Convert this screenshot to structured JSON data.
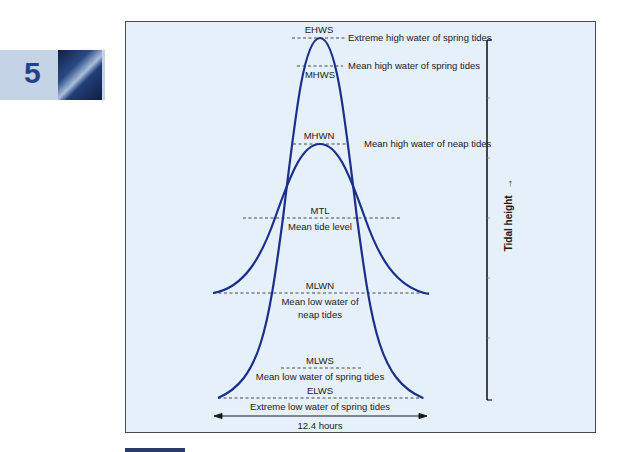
{
  "chapter": {
    "number": "5",
    "thumbnail": "chapter-photo-coastal-water"
  },
  "diagram": {
    "colors": {
      "panel_background": "#e6f0fa",
      "curve": "#1a2f8a",
      "dashed": "#333333",
      "chapter_tab": "#c4d3e6",
      "chapter_number": "#24418c"
    },
    "levels": [
      {
        "abbr": "EHWS",
        "name": "Extreme high water of spring tides"
      },
      {
        "abbr": "MHWS",
        "name": "Mean high water of spring tides"
      },
      {
        "abbr": "MHWN",
        "name": "Mean high water of neap tides"
      },
      {
        "abbr": "MTL",
        "name": "Mean tide level"
      },
      {
        "abbr": "MLWN",
        "name_line1": "Mean low water of",
        "name_line2": "neap tides"
      },
      {
        "abbr": "MLWS",
        "name": "Mean low water of spring tides"
      },
      {
        "abbr": "ELWS",
        "name": "Extreme low water of spring tides"
      }
    ],
    "curves": [
      {
        "name": "Spring tide curve"
      },
      {
        "name": "Neap tide curve"
      }
    ],
    "period_label": "12.4 hours",
    "y_axis_label": "Tidal height",
    "y_axis_arrow": "→"
  }
}
